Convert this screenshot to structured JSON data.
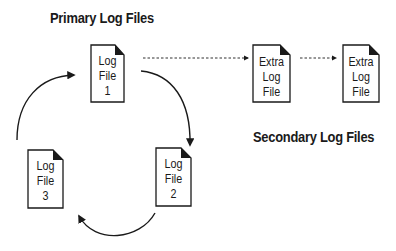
{
  "titles": {
    "primary": "Primary Log Files",
    "secondary": "Secondary Log Files"
  },
  "files": [
    {
      "id": "log1",
      "lines": [
        "Log",
        "File",
        "1"
      ]
    },
    {
      "id": "log2",
      "lines": [
        "Log",
        "File",
        "2"
      ]
    },
    {
      "id": "log3",
      "lines": [
        "Log",
        "File",
        "3"
      ]
    },
    {
      "id": "extra1",
      "lines": [
        "Extra",
        "Log",
        "File"
      ]
    },
    {
      "id": "extra2",
      "lines": [
        "Extra",
        "Log",
        "File"
      ]
    }
  ],
  "colors": {
    "stroke": "#1a1a1a",
    "fill": "#ffffff"
  }
}
